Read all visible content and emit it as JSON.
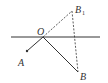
{
  "diagram": {
    "colors": {
      "stroke": "#333333",
      "background": "#ffffff"
    },
    "points": {
      "O": {
        "label": "O",
        "x": 43,
        "y": 37
      },
      "A": {
        "label": "A",
        "x": 27,
        "y": 51
      },
      "B": {
        "label": "B",
        "x": 78,
        "y": 72
      },
      "B1": {
        "label": "B",
        "subscript": "1",
        "x": 72,
        "y": 11
      }
    },
    "lines": [
      {
        "name": "horizontal-line",
        "style": "solid"
      },
      {
        "name": "segment-OA",
        "style": "solid"
      },
      {
        "name": "segment-OB",
        "style": "solid"
      },
      {
        "name": "segment-OB1",
        "style": "dashed"
      },
      {
        "name": "segment-B1B",
        "style": "dashed"
      }
    ]
  }
}
